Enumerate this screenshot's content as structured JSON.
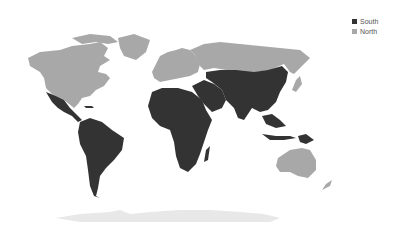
{
  "map": {
    "type": "choropleth-world",
    "projection": "equirectangular",
    "categories": [
      {
        "name": "South",
        "color": "#333333",
        "regions": [
          "Mexico",
          "Central America",
          "Caribbean",
          "South America",
          "Africa",
          "Middle East",
          "Central Asia",
          "South Asia",
          "China",
          "Mongolia",
          "Southeast Asia",
          "Papua New Guinea"
        ]
      },
      {
        "name": "North",
        "color": "#a8a8a8",
        "regions": [
          "Canada",
          "United States",
          "Greenland",
          "Europe",
          "Russia",
          "Japan",
          "South Korea",
          "Australia",
          "New Zealand"
        ]
      }
    ],
    "antarctica_color": "#e8e8e8"
  },
  "legend": {
    "items": [
      {
        "label": "South",
        "color": "#333333"
      },
      {
        "label": "North",
        "color": "#a8a8a8"
      }
    ]
  }
}
